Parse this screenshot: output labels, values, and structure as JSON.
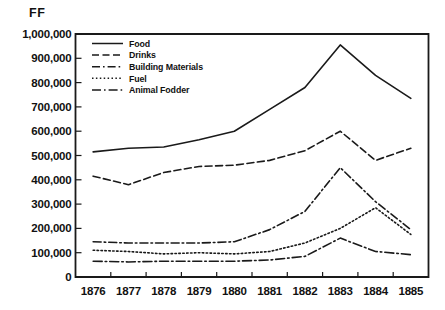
{
  "chart_data": {
    "type": "line",
    "title": "",
    "unit_label": "FF",
    "xlabel": "",
    "ylabel": "FF",
    "grid": false,
    "legend_position": "top-left-inside",
    "x": [
      "1876",
      "1877",
      "1878",
      "1879",
      "1880",
      "1881",
      "1882",
      "1883",
      "1884",
      "1885"
    ],
    "categories": [
      "1876",
      "1877",
      "1878",
      "1879",
      "1880",
      "1881",
      "1882",
      "1883",
      "1884",
      "1885"
    ],
    "ylim": [
      0,
      1000000
    ],
    "ytick_labels": [
      "1,000,000",
      "900,000",
      "800,000",
      "700,000",
      "600,000",
      "500,000",
      "400,000",
      "300,000",
      "200,000",
      "100,000",
      "0"
    ],
    "ytick_values": [
      1000000,
      900000,
      800000,
      700000,
      600000,
      500000,
      400000,
      300000,
      200000,
      100000,
      0
    ],
    "series": [
      {
        "name": "Food",
        "style": "solid",
        "values": [
          515000,
          530000,
          535000,
          565000,
          600000,
          690000,
          780000,
          955000,
          830000,
          735000
        ]
      },
      {
        "name": "Drinks",
        "style": "dashed",
        "values": [
          415000,
          380000,
          430000,
          455000,
          460000,
          480000,
          520000,
          600000,
          480000,
          530000
        ]
      },
      {
        "name": "Building Materials",
        "style": "dash-dot",
        "values": [
          145000,
          140000,
          140000,
          140000,
          145000,
          195000,
          270000,
          450000,
          310000,
          195000
        ]
      },
      {
        "name": "Fuel",
        "style": "dotted",
        "values": [
          110000,
          105000,
          95000,
          100000,
          95000,
          105000,
          140000,
          200000,
          285000,
          175000
        ]
      },
      {
        "name": "Animal Fodder",
        "style": "dash-dot-dot",
        "values": [
          65000,
          62000,
          65000,
          65000,
          65000,
          70000,
          85000,
          160000,
          105000,
          92000
        ]
      }
    ],
    "colors": {
      "axis": "#1a1a1a",
      "series": "#1a1a1a",
      "background": "#ffffff"
    }
  },
  "legend": {
    "entries": [
      {
        "label": "Food",
        "style": "solid"
      },
      {
        "label": "Drinks",
        "style": "dashed"
      },
      {
        "label": "Building Materials",
        "style": "dash-dot"
      },
      {
        "label": "Fuel",
        "style": "dotted"
      },
      {
        "label": "Animal Fodder",
        "style": "dash-dot-dot"
      }
    ]
  }
}
